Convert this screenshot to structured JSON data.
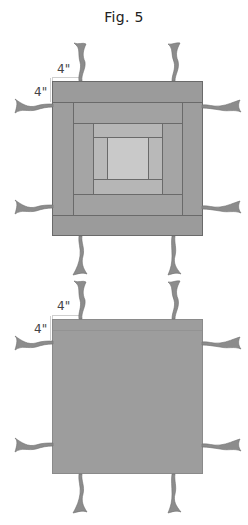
{
  "title": "Fig. 5",
  "colors": {
    "outer_ring": "#9b9b9b",
    "ring_2": "#a3a3a3",
    "ring_3": "#b6b6b6",
    "center": "#c9c9c9",
    "plain_block": "#9d9d9d",
    "ribbon": "#8a8a8a",
    "seam": "#6a6a6a"
  },
  "blocks": [
    {
      "name": "log-cabin-block",
      "dimension_labels": {
        "top": "4\"",
        "left": "4\""
      }
    },
    {
      "name": "plain-backing-block",
      "dimension_labels": {
        "top": "4\"",
        "left": "4\""
      }
    }
  ]
}
